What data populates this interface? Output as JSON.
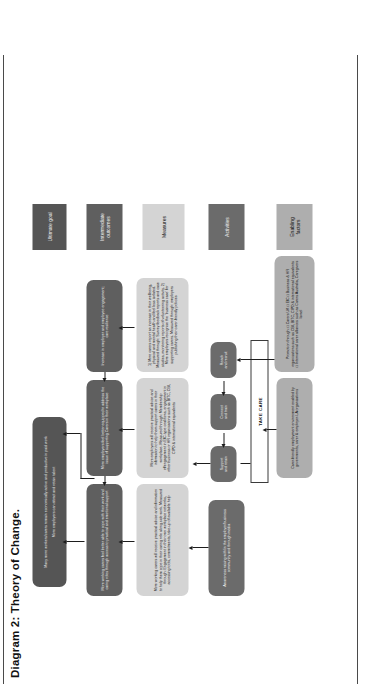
{
  "figure": {
    "title": "Diagram 2:  Theory of Change."
  },
  "legend": {
    "items": [
      {
        "key": "ultimate_goal",
        "label": "Ultimate goal",
        "color": "#555555"
      },
      {
        "key": "intermediate_outcomes",
        "label": "Intermediate\noutcomes",
        "color": "#5f5f5f"
      },
      {
        "key": "measures",
        "label": "Measures",
        "color": "#d4d4d4"
      },
      {
        "key": "activities",
        "label": "Activities",
        "color": "#6b6b6b"
      },
      {
        "key": "enabling_factors",
        "label": "Enabling\nfactors",
        "color": "#aeaeae"
      }
    ]
  },
  "goals": [
    {
      "key": "goal_1",
      "text": "Many more workers/carers remain economically active and productive in paid work"
    },
    {
      "key": "goal_2",
      "text": "More employers can attract and retain talent"
    }
  ],
  "outcomes": [
    {
      "key": "outcome_1",
      "text": "More working carers feel better able to cope with their work and caring roles through access to practical and emotional support"
    },
    {
      "key": "outcome_2",
      "text": "More employers feel better equipped to address the issue of supporting Carers in their workplace"
    },
    {
      "key": "outcome_3",
      "text": "Increase in employer and employee engagement; care resilience"
    }
  ],
  "measures": [
    {
      "key": "measure_1",
      "text": "More working carers will receive practical advice and information to help them cope in their caring role along side work. Measured through: Engagement in their own workplace networks, accessing tools, commitments, take-up of available help"
    },
    {
      "key": "measure_2",
      "text": "More employers will receive practical advice and information to help them support carers in their workplace. Measured through: Membership of/engagement in EfC-type coalitions, engagement in other business or HR organisations such as BITC, CBI, CIPD & international equivalents"
    },
    {
      "key": "measure_3",
      "text": "1) More carers report an increase in their wellbeing, physical and mental health and feel less isolated. Measured through: Survey feedback reports and case studies, monitoring reports of volunteering activity. 2) More employers recognise the 'business case' for supporting carers. Measured through: employers publishing their carer-friendly policies"
    }
  ],
  "activities": [
    {
      "key": "activity_awareness",
      "text": "Awareness raising with/in the employer/business community and through media"
    },
    {
      "key": "activity_reach",
      "text": "Reach\nand recruit"
    },
    {
      "key": "activity_connect",
      "text": "Connect\nand train"
    },
    {
      "key": "activity_support",
      "text": "Support\nand retain"
    }
  ],
  "enabling": [
    {
      "key": "enabling_1",
      "text": "Carer-friendly employment environment enabled by governments, carer & employer-LA organisations"
    },
    {
      "key": "enabling_2",
      "text": "Promotion through:  □ Carers UK   □ EfC  □ Business & HR organisations such as CBI, BITC, CIPD & international equivalents\n□ International carer alliances such as Carers Australia, Caregivers Israel"
    }
  ],
  "programme": {
    "label": "TAKE CARE"
  }
}
